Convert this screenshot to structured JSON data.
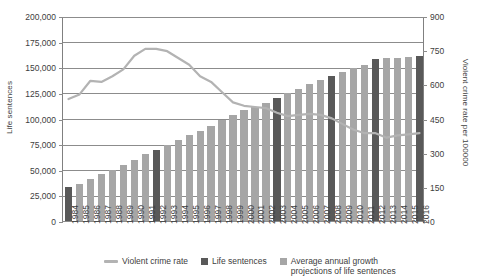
{
  "chart_data": {
    "type": "bar",
    "title": "",
    "xlabel": "",
    "ylabel": "Life sentences",
    "y2label": "Violent crime rate per 100000",
    "ylim": [
      0,
      200000
    ],
    "y2lim": [
      0,
      900
    ],
    "grid": true,
    "legend_position": "bottom",
    "categories": [
      "1984",
      "1985",
      "1986",
      "1987",
      "1988",
      "1989",
      "1990",
      "1991",
      "1992",
      "1993",
      "1994",
      "1995",
      "1996",
      "1997",
      "1998",
      "1999",
      "2000",
      "2001",
      "2002",
      "2003",
      "2004",
      "2005",
      "2006",
      "2007",
      "2008",
      "2009",
      "2010",
      "2011",
      "2012",
      "2013",
      "2014",
      "2015",
      "2016"
    ],
    "left_ticks": [
      "0",
      "25,000",
      "50,000",
      "75,000",
      "100,000",
      "125,000",
      "150,000",
      "175,000",
      "200,000"
    ],
    "right_ticks": [
      "0",
      "150",
      "300",
      "450",
      "600",
      "750",
      "900"
    ],
    "series": [
      {
        "name": "Life sentences",
        "type": "bar",
        "axis": "left",
        "color": "#595959",
        "highlight_years": [
          "1984",
          "1992",
          "2003",
          "2008",
          "2012",
          "2016"
        ],
        "values": [
          34000,
          37500,
          41500,
          46500,
          51000,
          56000,
          60500,
          66000,
          70000,
          75500,
          80500,
          84500,
          89000,
          94000,
          100000,
          104500,
          109000,
          112500,
          116000,
          121000,
          125500,
          130000,
          134500,
          138500,
          142500,
          146000,
          150000,
          153500,
          159500,
          160000,
          160500,
          161000,
          161500
        ]
      },
      {
        "name": "Average annual growth projections of life sentences",
        "type": "bar",
        "axis": "left",
        "color": "#a6a6a6"
      },
      {
        "name": "Violent crime rate",
        "type": "line",
        "axis": "right",
        "color": "#b3b3b3",
        "values": [
          540,
          560,
          620,
          615,
          640,
          670,
          730,
          760,
          760,
          750,
          720,
          690,
          640,
          615,
          570,
          525,
          510,
          505,
          500,
          480,
          465,
          470,
          475,
          470,
          455,
          430,
          405,
          390,
          390,
          370,
          380,
          385,
          390
        ]
      }
    ]
  },
  "legend": {
    "items": [
      {
        "label": "Violent crime rate",
        "marker": "line",
        "color": "#b3b3b3"
      },
      {
        "label": "Life sentences",
        "marker": "box",
        "color": "#595959"
      },
      {
        "label": "Average annual growth\nprojections of life sentences",
        "marker": "box",
        "color": "#a6a6a6"
      }
    ]
  }
}
